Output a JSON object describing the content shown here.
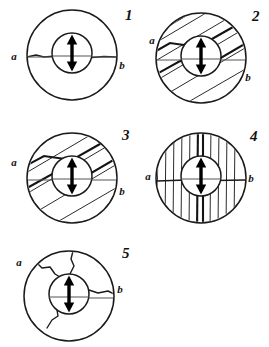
{
  "figure": {
    "background_color": "#ffffff",
    "ink_color": "#1a1a1a",
    "width": 269,
    "height": 347
  },
  "labels": {
    "left": "a",
    "right": "b"
  },
  "panels": [
    {
      "id": "panel-1",
      "number": "1",
      "pattern": "single-horizontal-crack",
      "description": "Plain disc with a single irregular horizontal crack running from a to b through the centre hole",
      "number_position": {
        "x": 125,
        "y": 20
      },
      "label_a": {
        "x": 14,
        "y": 60
      },
      "label_b": {
        "x": 122,
        "y": 69
      },
      "outer": {
        "cx": 72,
        "cy": 55,
        "r": 45
      },
      "inner": {
        "cx": 72,
        "cy": 53,
        "r": 20
      },
      "hatch_count": 0
    },
    {
      "id": "panel-2",
      "number": "2",
      "pattern": "diagonal-hatching-shallow",
      "description": "Disc filled with shallow diagonal crack lines rising left to right",
      "number_position": {
        "x": 252,
        "y": 21
      },
      "label_a": {
        "x": 152,
        "y": 44
      },
      "label_b": {
        "x": 248,
        "y": 81
      },
      "outer": {
        "cx": 201,
        "cy": 58,
        "r": 45
      },
      "inner": {
        "cx": 201,
        "cy": 56,
        "r": 20
      },
      "hatch_count": 7
    },
    {
      "id": "panel-3",
      "number": "3",
      "pattern": "diagonal-hatching-steep",
      "description": "Disc filled with steeper diagonal crack lines rising left to right",
      "number_position": {
        "x": 122,
        "y": 140
      },
      "label_a": {
        "x": 14,
        "y": 166
      },
      "label_b": {
        "x": 122,
        "y": 195
      },
      "outer": {
        "cx": 72,
        "cy": 178,
        "r": 45
      },
      "inner": {
        "cx": 72,
        "cy": 176,
        "r": 20
      },
      "hatch_count": 7
    },
    {
      "id": "panel-4",
      "number": "4",
      "pattern": "vertical-hatching",
      "description": "Disc filled with many vertical crack lines plus a horizontal crack from a to b",
      "number_position": {
        "x": 250,
        "y": 141
      },
      "label_a": {
        "x": 148,
        "y": 180
      },
      "label_b": {
        "x": 251,
        "y": 182
      },
      "outer": {
        "cx": 201,
        "cy": 178,
        "r": 45
      },
      "inner": {
        "cx": 201,
        "cy": 176,
        "r": 20
      },
      "hatch_count": 12
    },
    {
      "id": "panel-5",
      "number": "5",
      "pattern": "radial-branching-cracks",
      "description": "Disc with irregular branching cracks radiating outward from the centre hole",
      "number_position": {
        "x": 122,
        "y": 258
      },
      "label_a": {
        "x": 19,
        "y": 266
      },
      "label_b": {
        "x": 120,
        "y": 293
      },
      "outer": {
        "cx": 69,
        "cy": 296,
        "r": 45
      },
      "inner": {
        "cx": 69,
        "cy": 294,
        "r": 20
      },
      "hatch_count": 0
    }
  ],
  "arrow": {
    "name": "double-headed-vertical-arrow",
    "meaning": "loading direction",
    "color": "#000000"
  }
}
